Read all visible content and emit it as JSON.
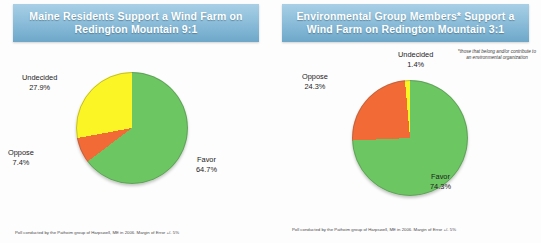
{
  "chart_data": [
    {
      "type": "pie",
      "id": "maine-residents",
      "title": "Maine Residents Support a Wind Farm on Redington Mountain 9:1",
      "categories": [
        "Favor",
        "Oppose",
        "Undecided"
      ],
      "values": [
        64.7,
        7.4,
        27.9
      ],
      "value_labels": [
        "64.7%",
        "7.4%",
        "27.9%"
      ],
      "colors": [
        "#6cc662",
        "#f26b37",
        "#fbf526"
      ],
      "start_angle": 0,
      "direction": "clockwise",
      "legend": "none",
      "labels_position": "outside",
      "source": "Poll conducted by the Pathoim group of Harpswell, ME in 2006. Margin of Error +/- 5%"
    },
    {
      "type": "pie",
      "id": "environmental-group-members",
      "title": "Environmental Group Members* Support a Wind Farm on Redington Mountain 3:1",
      "categories": [
        "Favor",
        "Oppose",
        "Undecided"
      ],
      "values": [
        74.3,
        24.3,
        1.4
      ],
      "value_labels": [
        "74.3%",
        "24.3%",
        "1.4%"
      ],
      "colors": [
        "#6cc662",
        "#f26b37",
        "#fbf526"
      ],
      "start_angle": 0,
      "direction": "clockwise",
      "legend": "none",
      "labels_position": "outside",
      "footnote": "*those that belong and/or contribute to an environmental organization",
      "source": "Poll conducted by the Pathoim group of Harpswell, ME in 2006. Margin of Error +/- 5%"
    }
  ],
  "left_panel": {
    "banner_title": "Maine Residents Support a Wind Farm on Redington Mountain 9:1",
    "labels": {
      "undecided_name": "Undecided",
      "undecided_pct": "27.9%",
      "oppose_name": "Oppose",
      "oppose_pct": "7.4%",
      "favor_name": "Favor",
      "favor_pct": "64.7%"
    },
    "source": "Poll conducted by the Pathoim group of Harpswell, ME in 2006. Margin of Error +/- 5%"
  },
  "right_panel": {
    "banner_title": "Environmental Group Members* Support a Wind Farm on Redington Mountain 3:1",
    "labels": {
      "undecided_name": "Undecided",
      "undecided_pct": "1.4%",
      "oppose_name": "Oppose",
      "oppose_pct": "24.3%",
      "favor_name": "Favor",
      "favor_pct": "74.3%"
    },
    "note_star": "*",
    "note_text": "those that belong and/or contribute to an environmental organization",
    "source": "Poll conducted by the Pathoim group of Harpswell, ME in 2006. Margin of Error +/- 5%"
  }
}
